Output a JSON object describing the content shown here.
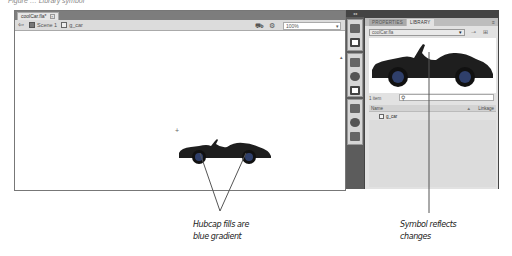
{
  "figure_caption": "Figure … Library symbol",
  "document": {
    "tab_label": "coolCar.fla*",
    "tab_close_icon": "close-icon",
    "breadcrumbs": [
      {
        "icon": "scene-icon",
        "label": "Scene 1"
      },
      {
        "icon": "graphic-symbol-icon",
        "label": "g_car"
      }
    ],
    "back_icon": "back-arrow-icon",
    "edit_symbols_icon": "edit-symbols-icon",
    "edit_scene_icon": "edit-scene-icon",
    "zoom_level": "100%"
  },
  "dock": {
    "collapse_label": "◂◂",
    "icons": [
      "color-icon",
      "swatches-icon",
      "align-icon",
      "info-icon",
      "transform-icon",
      "code-snippets-icon",
      "components-icon",
      "movie-explorer-icon"
    ]
  },
  "library_panel": {
    "tabs": [
      {
        "label": "PROPERTIES",
        "active": false
      },
      {
        "label": "LIBRARY",
        "active": true
      }
    ],
    "menu_icon": "panel-menu-icon",
    "document_select": "coolCar.fla",
    "pin_icon": "pin-icon",
    "new_library_icon": "new-library-panel-icon",
    "item_count": "1 item",
    "search_placeholder": "",
    "columns": {
      "name": "Name",
      "sort": "▲",
      "linkage": "Linkage"
    },
    "items": [
      {
        "type": "graphic",
        "name": "g_car"
      }
    ]
  },
  "callouts": [
    {
      "lines": [
        "Hubcap fills are",
        "blue gradient"
      ]
    },
    {
      "lines": [
        "Symbol reflects",
        "changes"
      ]
    }
  ],
  "colors": {
    "car_body": "#1e1e1e",
    "hubcap": "#2f3f6a",
    "panel_dark": "#5c5c5c",
    "panel_light": "#e2e2e2"
  }
}
